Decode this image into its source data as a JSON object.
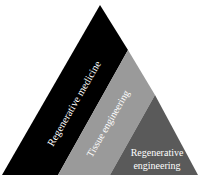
{
  "diagram": {
    "type": "triangle-layers",
    "colors": {
      "background": "#ffffff",
      "band_outer": "#000000",
      "band_middle": "#9a9a9a",
      "band_inner": "#5a5a5a",
      "text": "#ffffff"
    },
    "layers": [
      {
        "label": "Regenerative medicine"
      },
      {
        "label": "Tissue engineering"
      },
      {
        "label_line1": "Regenerative",
        "label_line2": "engineering"
      }
    ]
  }
}
